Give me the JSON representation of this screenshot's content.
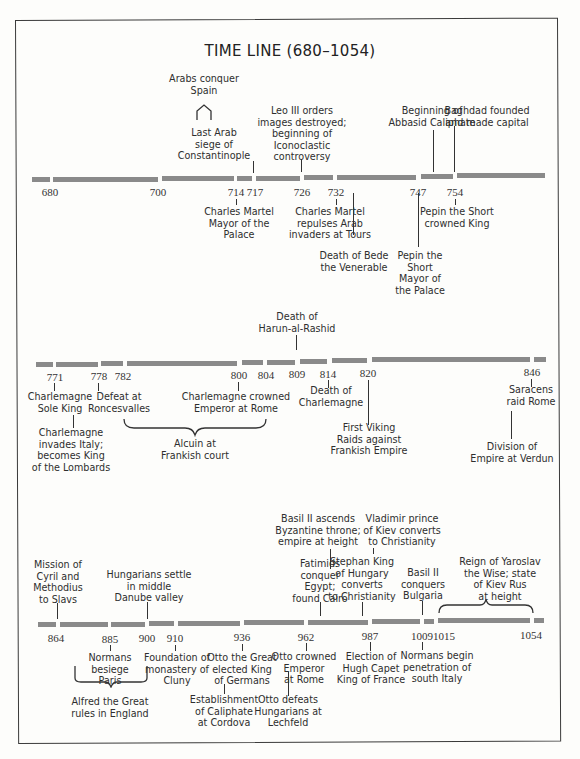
{
  "title": "TIME LINE (680–1054)",
  "colors": {
    "bar": "#8a8a8a",
    "ink": "#2e2e2e",
    "frame": "#3a3a3a"
  },
  "rows": [
    {
      "years": [
        "680",
        "700",
        "714",
        "717",
        "726",
        "732",
        "747",
        "754"
      ],
      "events": {
        "arabs_spain": "Arabs conquer\nSpain",
        "last_arab_siege": "Last Arab\nsiege of\nConstantinople",
        "leo_iii": "Leo III orders\nimages destroyed;\nbeginning of\nIconoclastic\ncontroversy",
        "abbasid": "Beginning of\nAbbasid Caliphate",
        "baghdad": "Baghdad founded\nand made capital",
        "martel_mayor": "Charles Martel\nMayor of the\nPalace",
        "martel_tours": "Charles Martel\nrepulses Arab\ninvaders at Tours",
        "bede": "Death of Bede\nthe Venerable",
        "pepin_mayor": "Pepin the\nShort\nMayor of\nthe Palace",
        "pepin_king": "Pepin the Short\ncrowned King"
      }
    },
    {
      "years": [
        "771",
        "778",
        "782",
        "800",
        "804",
        "809",
        "814",
        "820",
        "846"
      ],
      "events": {
        "harun": "Death of\nHarun-al-Rashid",
        "sole_king": "Charlemagne\nSole King",
        "roncesvalles": "Defeat at\nRoncesvalles",
        "invades_italy": "Charlemagne\ninvades Italy;\nbecomes King\nof the Lombards",
        "crowned_emperor": "Charlemagne crowned\nEmperor at Rome",
        "alcuin": "Alcuin at\nFrankish court",
        "death_charlemagne": "Death of\nCharlemagne",
        "viking": "First Viking\nRaids against\nFrankish Empire",
        "saracens": "Saracens\nraid Rome",
        "verdun": "Division of\nEmpire at Verdun"
      }
    },
    {
      "years": [
        "864",
        "885",
        "900",
        "910",
        "936",
        "962",
        "987",
        "1009",
        "1015",
        "1054"
      ],
      "events": {
        "cyril": "Mission of\nCyril and\nMethodius\nto Slavs",
        "hungarians_settle": "Hungarians settle\nin middle\nDanube valley",
        "basil_ascends": "Basil II ascends\nByzantine throne;\nempire at height",
        "fatimids": "Fatimids\nconquer\nEgypt;\nfound Cairo",
        "vladimir": "Vladimir prince\nof Kiev converts\nto Christianity",
        "stephan": "Stephan King\nof Hungary\nconverts\nto Christianity",
        "basil_bulgaria": "Basil II\nconquers\nBulgaria",
        "yaroslav": "Reign of Yaroslav\nthe Wise; state\nof Kiev Rus\nat height",
        "normans_paris": "Normans\nbesiege\nParis",
        "alfred": "Alfred the Great\nrules in England",
        "cluny": "Foundation of\nmonastery of\nCluny",
        "otto_king": "Otto the Great\nelected King\nof Germans",
        "cordova": "Establishment\nof Caliphate\nat Cordova",
        "otto_emperor": "Otto crowned\nEmperor\nat Rome",
        "lechfeld": "Otto defeats\nHungarians at\nLechfeld",
        "capet": "Election of\nHugh Capet\nKing of France",
        "normans_italy": "Normans begin\npenetration of\nsouth Italy"
      }
    }
  ]
}
